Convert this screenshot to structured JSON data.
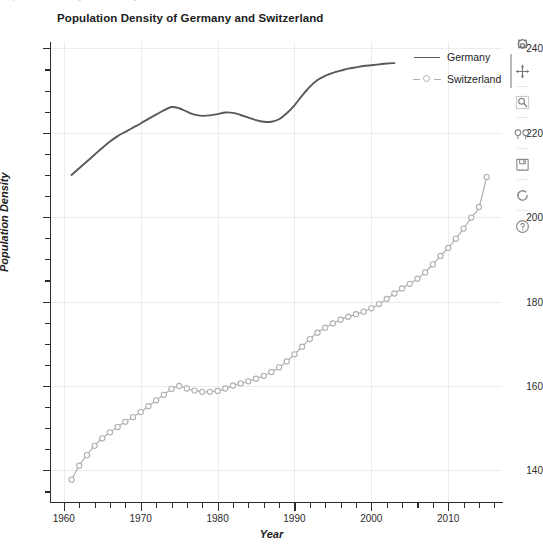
{
  "figure": {
    "title": "Population Density of Germany and Switzerland",
    "ghost_text": "Population Density of Germany and Switzerland",
    "background_color": "#ffffff",
    "grid_color": "#ececed",
    "axis_color": "#2b2b2b"
  },
  "axes": {
    "x": {
      "title": "Year",
      "ticks": [
        1960,
        1970,
        1980,
        1990,
        2000,
        2010
      ],
      "tick_labels": [
        "1960",
        "1970",
        "1980",
        "1990",
        "2000",
        "2010"
      ],
      "range": [
        1958.2,
        1917.0
      ],
      "minor_tick_step": 2
    },
    "y": {
      "title": "Population Density",
      "ticks": [
        140,
        160,
        180,
        200,
        220,
        240
      ],
      "tick_labels": [
        "140",
        "160",
        "180",
        "200",
        "220",
        "240"
      ],
      "range": [
        132.5,
        241.5
      ],
      "minor_tick_step": 5
    }
  },
  "legend": {
    "position": "top-right",
    "items": [
      {
        "label": "Germany",
        "style": "solid-line",
        "color": "#595959",
        "marker": "none"
      },
      {
        "label": "Switzerland",
        "style": "line-with-markers",
        "color": "#b0b0b0",
        "marker": "open-circle"
      }
    ]
  },
  "modebar": {
    "buttons": [
      {
        "name": "download-plot-icon",
        "title": "Download plot as a png"
      },
      {
        "name": "pan-icon",
        "title": "Pan"
      },
      {
        "name": "zoom-box-icon",
        "title": "Box zoom"
      },
      {
        "name": "zoom-in-out-icon",
        "title": "Zoom in / Zoom out"
      },
      {
        "name": "save-icon",
        "title": "Save"
      },
      {
        "name": "reset-axes-icon",
        "title": "Reset axes"
      },
      {
        "name": "help-icon",
        "title": "Help"
      }
    ]
  },
  "chart_data": {
    "type": "line",
    "title": "Population Density of Germany and Switzerland",
    "xlabel": "Year",
    "ylabel": "Population Density",
    "xlim": [
      1958.2,
      2017.0
    ],
    "ylim": [
      132.5,
      241.5
    ],
    "grid": true,
    "legend_position": "top-right",
    "series": [
      {
        "name": "Germany",
        "color": "#595959",
        "marker": "none",
        "x": [
          1961,
          1962,
          1963,
          1964,
          1965,
          1966,
          1967,
          1968,
          1969,
          1970,
          1971,
          1972,
          1973,
          1974,
          1975,
          1976,
          1977,
          1978,
          1979,
          1980,
          1981,
          1982,
          1983,
          1984,
          1985,
          1986,
          1987,
          1988,
          1989,
          1990,
          1991,
          1992,
          1993,
          1994,
          1995,
          1996,
          1997,
          1998,
          1999,
          2000,
          2001,
          2002,
          2003
        ],
        "y": [
          210.0,
          211.6,
          213.2,
          214.8,
          216.4,
          217.9,
          219.2,
          220.2,
          221.2,
          222.2,
          223.3,
          224.3,
          225.3,
          226.1,
          225.8,
          225.0,
          224.3,
          224.0,
          224.1,
          224.4,
          224.8,
          224.7,
          224.2,
          223.6,
          223.0,
          222.6,
          222.6,
          223.2,
          224.6,
          226.5,
          228.8,
          230.9,
          232.5,
          233.5,
          234.2,
          234.7,
          235.2,
          235.5,
          235.8,
          236.0,
          236.2,
          236.4,
          236.5
        ]
      },
      {
        "name": "Switzerland",
        "color": "#b0b0b0",
        "marker": "open-circle",
        "x": [
          1961,
          1962,
          1963,
          1964,
          1965,
          1966,
          1967,
          1968,
          1969,
          1970,
          1971,
          1972,
          1973,
          1974,
          1975,
          1976,
          1977,
          1978,
          1979,
          1980,
          1981,
          1982,
          1983,
          1984,
          1985,
          1986,
          1987,
          1988,
          1989,
          1990,
          1991,
          1992,
          1993,
          1994,
          1995,
          1996,
          1997,
          1998,
          1999,
          2000,
          2001,
          2002,
          2003,
          2004,
          2005,
          2006,
          2007,
          2008,
          2009,
          2010,
          2011,
          2012,
          2013,
          2014,
          2015
        ],
        "y": [
          137.8,
          141.1,
          143.6,
          145.8,
          147.6,
          149.0,
          150.3,
          151.5,
          152.6,
          153.8,
          155.2,
          156.6,
          157.9,
          159.3,
          160.0,
          159.4,
          158.9,
          158.6,
          158.6,
          158.8,
          159.4,
          160.1,
          160.6,
          161.1,
          161.7,
          162.4,
          163.3,
          164.4,
          165.8,
          167.5,
          169.3,
          171.1,
          172.6,
          173.8,
          174.8,
          175.7,
          176.4,
          177.0,
          177.6,
          178.4,
          179.4,
          180.6,
          181.9,
          183.1,
          184.2,
          185.4,
          186.9,
          188.8,
          190.8,
          192.7,
          194.9,
          197.3,
          199.9,
          202.4,
          209.5
        ]
      }
    ]
  }
}
